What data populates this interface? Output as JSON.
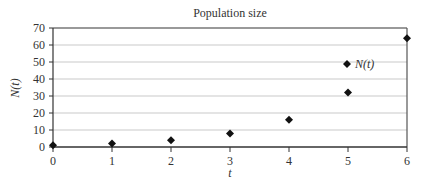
{
  "chart_data": {
    "type": "scatter",
    "title": "Population size",
    "xlabel": "t",
    "ylabel": "N(t)",
    "x": [
      0,
      1,
      2,
      3,
      4,
      5,
      6
    ],
    "series": [
      {
        "name": "N(t)",
        "marker": "diamond",
        "color": "#111111",
        "values": [
          1,
          2,
          4,
          8,
          16,
          32,
          64
        ]
      }
    ],
    "xlim": [
      0,
      6
    ],
    "ylim": [
      0,
      70
    ],
    "xticks": [
      0,
      1,
      2,
      3,
      4,
      5,
      6
    ],
    "yticks": [
      0,
      10,
      20,
      30,
      40,
      50,
      60,
      70
    ],
    "grid": "horizontal",
    "legend_position": "top-right-inside"
  }
}
